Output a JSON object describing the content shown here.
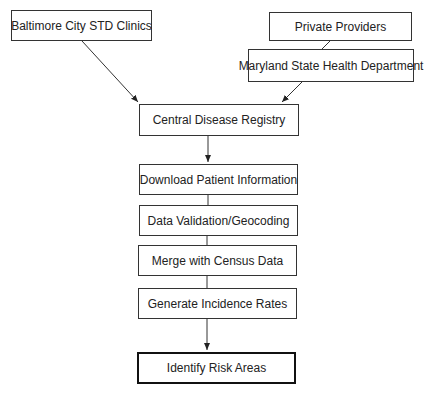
{
  "diagram": {
    "type": "flowchart",
    "nodes": {
      "baltimore": "Baltimore City STD Clinics",
      "private": "Private Providers",
      "maryland": "Maryland State Health Department",
      "registry": "Central Disease Registry",
      "download": "Download Patient Information",
      "validation": "Data Validation/Geocoding",
      "merge": "Merge with Census Data",
      "generate": "Generate Incidence Rates",
      "identify": "Identify Risk Areas"
    },
    "edges": [
      [
        "baltimore",
        "registry"
      ],
      [
        "private",
        "maryland"
      ],
      [
        "maryland",
        "registry"
      ],
      [
        "registry",
        "download"
      ],
      [
        "download",
        "validation"
      ],
      [
        "validation",
        "merge"
      ],
      [
        "merge",
        "generate"
      ],
      [
        "generate",
        "identify"
      ]
    ]
  }
}
